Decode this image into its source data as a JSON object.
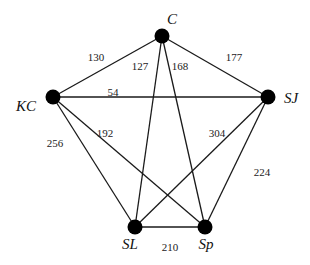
{
  "graph": {
    "nodes": [
      {
        "id": "C",
        "label": "C",
        "x": 162,
        "y": 36,
        "lx": 172,
        "ly": 24,
        "anchor": "middle"
      },
      {
        "id": "KC",
        "label": "KC",
        "x": 53,
        "y": 97,
        "lx": 26,
        "ly": 111,
        "anchor": "middle"
      },
      {
        "id": "SJ",
        "label": "SJ",
        "x": 268,
        "y": 97,
        "lx": 291,
        "ly": 103,
        "anchor": "middle"
      },
      {
        "id": "SL",
        "label": "SL",
        "x": 135,
        "y": 227,
        "lx": 130,
        "ly": 249,
        "anchor": "middle"
      },
      {
        "id": "Sp",
        "label": "Sp",
        "x": 205,
        "y": 227,
        "lx": 206,
        "ly": 249,
        "anchor": "middle"
      }
    ],
    "edges": [
      {
        "from": "C",
        "to": "KC",
        "weight": "130",
        "wx": 96,
        "wy": 61
      },
      {
        "from": "C",
        "to": "SJ",
        "weight": "177",
        "wx": 234,
        "wy": 61
      },
      {
        "from": "C",
        "to": "SL",
        "weight": "127",
        "wx": 140,
        "wy": 70
      },
      {
        "from": "C",
        "to": "Sp",
        "weight": "168",
        "wx": 180,
        "wy": 70
      },
      {
        "from": "KC",
        "to": "SJ",
        "weight": "54",
        "wx": 113,
        "wy": 96
      },
      {
        "from": "KC",
        "to": "SL",
        "weight": "256",
        "wx": 55,
        "wy": 147
      },
      {
        "from": "KC",
        "to": "Sp",
        "weight": "192",
        "wx": 105,
        "wy": 137
      },
      {
        "from": "SJ",
        "to": "SL",
        "weight": "304",
        "wx": 217,
        "wy": 137
      },
      {
        "from": "SJ",
        "to": "Sp",
        "weight": "224",
        "wx": 262,
        "wy": 176
      },
      {
        "from": "SL",
        "to": "Sp",
        "weight": "210",
        "wx": 170,
        "wy": 251
      }
    ]
  }
}
